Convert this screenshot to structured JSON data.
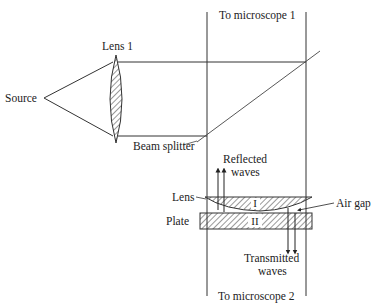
{
  "diagram": {
    "type": "optical interference setup",
    "labels": {
      "source": "Source",
      "lens1": "Lens 1",
      "beam_splitter": "Beam splitter",
      "microscope1": "To microscope 1",
      "microscope2": "To microscope 2",
      "reflected_line1": "Reflected",
      "reflected_line2": "waves",
      "transmitted_line1": "Transmitted",
      "transmitted_line2": "waves",
      "lens": "Lens",
      "plate": "Plate",
      "air_gap": "Air gap",
      "region_lens": "I",
      "region_plate": "II"
    },
    "colors": {
      "line": "#333333",
      "background": "#ffffff"
    }
  }
}
